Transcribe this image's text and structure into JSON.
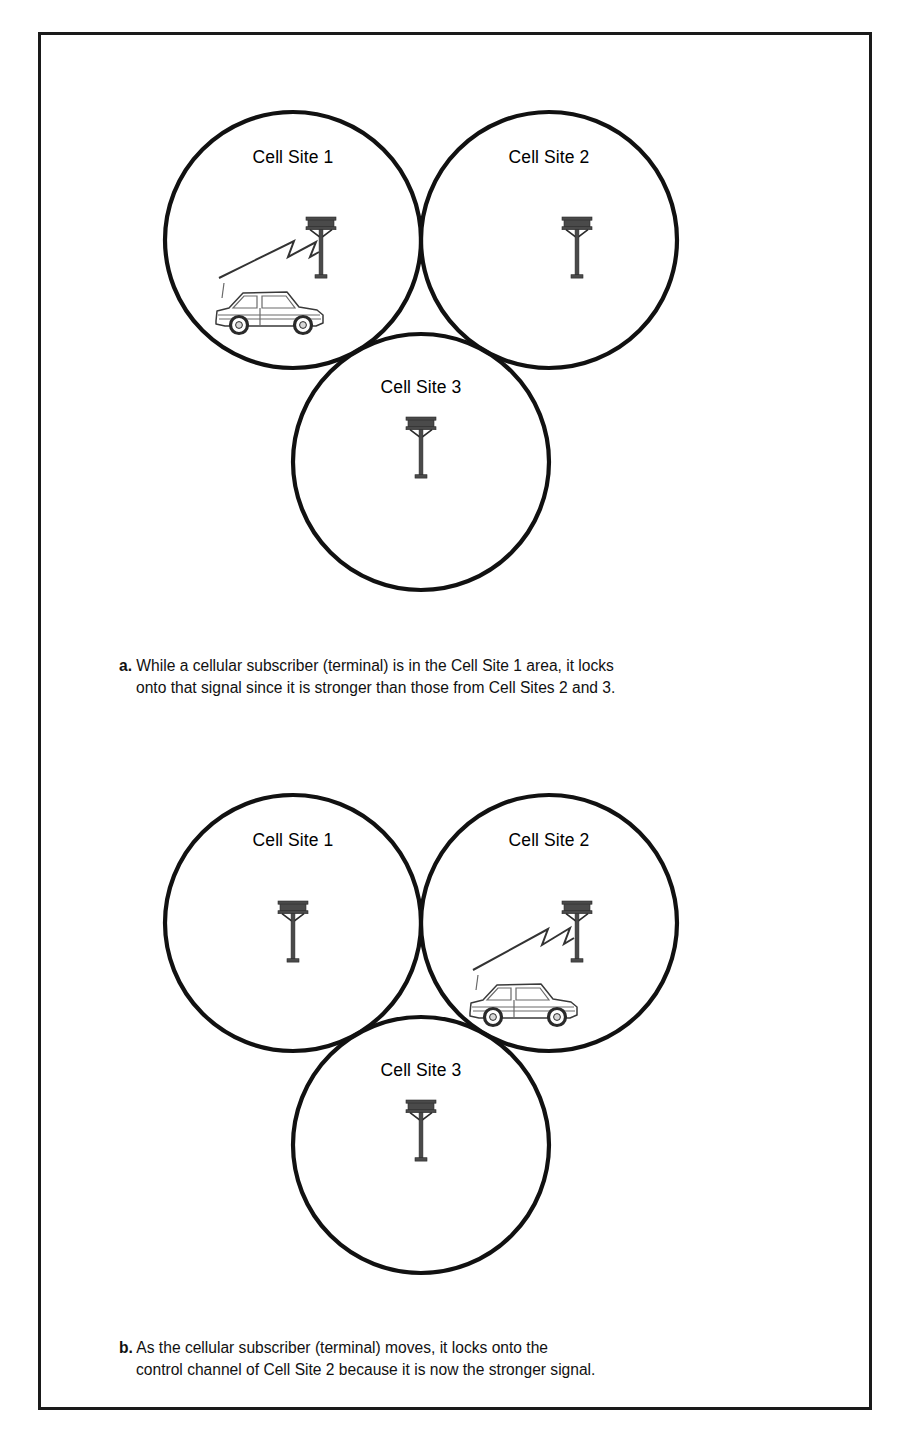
{
  "figure": {
    "border_color": "#1a1a1a",
    "background": "#ffffff"
  },
  "panels": [
    {
      "id": "a",
      "marker": "a.",
      "caption_line_1": "While a cellular subscriber (terminal) is in the Cell Site 1 area, it locks",
      "caption_line_2": "onto that signal since it is stronger than those from Cell Sites 2 and 3.",
      "cells": [
        {
          "label": "Cell Site 1",
          "has_tower": true,
          "has_car": true,
          "has_signal": true
        },
        {
          "label": "Cell Site 2",
          "has_tower": true,
          "has_car": false,
          "has_signal": false
        },
        {
          "label": "Cell Site 3",
          "has_tower": true,
          "has_car": false,
          "has_signal": false
        }
      ]
    },
    {
      "id": "b",
      "marker": "b.",
      "caption_line_1": "As the  cellular subscriber (terminal) moves, it locks onto the",
      "caption_line_2": "control channel of Cell Site 2 because it is now the stronger signal.",
      "cells": [
        {
          "label": "Cell Site 1",
          "has_tower": true,
          "has_car": false,
          "has_signal": false
        },
        {
          "label": "Cell Site 2",
          "has_tower": true,
          "has_car": true,
          "has_signal": true
        },
        {
          "label": "Cell Site 3",
          "has_tower": true,
          "has_car": false,
          "has_signal": false
        }
      ]
    }
  ],
  "labels": {
    "panel_a_cell_1": "Cell Site 1",
    "panel_a_cell_2": "Cell Site 2",
    "panel_a_cell_3": "Cell Site 3",
    "panel_b_cell_1": "Cell Site 1",
    "panel_b_cell_2": "Cell Site 2",
    "panel_b_cell_3": "Cell Site 3"
  },
  "icons": {
    "tower": "cell-tower-icon",
    "car": "car-icon",
    "signal": "radio-signal-bolt-icon"
  },
  "colors": {
    "circle_stroke": "#111111",
    "text": "#000000",
    "tower": "#4a4a4a",
    "signal": "#333333"
  }
}
